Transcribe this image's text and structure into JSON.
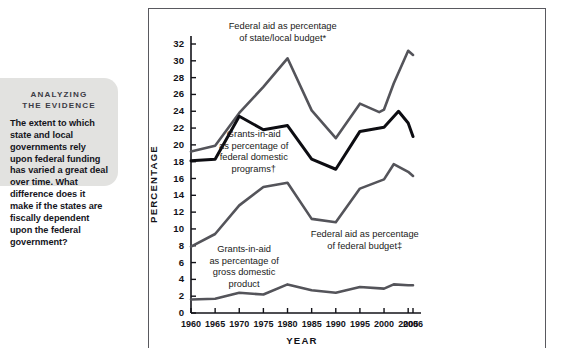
{
  "callout": {
    "kicker_line1": "ANALYZING",
    "kicker_line2": "THE EVIDENCE",
    "body": "The extent to which state and local governments rely upon federal funding has varied a great deal over time. What difference does it make if the states are fiscally dependent upon the federal government?"
  },
  "chart_data": {
    "type": "line",
    "title": "",
    "xlabel": "YEAR",
    "ylabel": "PERCENTAGE",
    "x": [
      1960,
      1965,
      1970,
      1975,
      1980,
      1985,
      1990,
      1995,
      2000,
      2005,
      2006
    ],
    "xtick_labels": [
      "1960",
      "1965",
      "1970",
      "1975",
      "1980",
      "1985",
      "1990",
      "1995",
      "2000",
      "2005",
      "2006"
    ],
    "ytick_labels": [
      "0",
      "2",
      "4",
      "6",
      "8",
      "10",
      "12",
      "14",
      "16",
      "18",
      "20",
      "22",
      "24",
      "26",
      "28",
      "30",
      "32"
    ],
    "ytick_values": [
      0,
      2,
      4,
      6,
      8,
      10,
      12,
      14,
      16,
      18,
      20,
      22,
      24,
      26,
      28,
      30,
      32
    ],
    "ylim": [
      0,
      33
    ],
    "xlim": [
      1960,
      2006
    ],
    "grid": false,
    "legend": "inline-annotations",
    "series": [
      {
        "name": "Federal aid as percentage of state/local budget*",
        "color": "#54545a",
        "width": 2.6,
        "x": [
          1960,
          1965,
          1970,
          1975,
          1980,
          1985,
          1990,
          1995,
          1999,
          2000,
          2002,
          2005,
          2006
        ],
        "values": [
          19.2,
          19.9,
          23.8,
          26.9,
          30.3,
          24.1,
          20.8,
          24.9,
          23.9,
          24.2,
          27.3,
          31.2,
          30.7
        ]
      },
      {
        "name": "Grants-in-aid as percentage of federal domestic programs†",
        "color": "#0d0d12",
        "width": 3.0,
        "x": [
          1960,
          1965,
          1970,
          1975,
          1980,
          1985,
          1990,
          1995,
          2000,
          2003,
          2005,
          2006
        ],
        "values": [
          18.1,
          18.3,
          23.4,
          21.8,
          22.3,
          18.3,
          17.1,
          21.6,
          22.1,
          24.0,
          22.6,
          21.0
        ]
      },
      {
        "name": "Federal aid as percentage of federal budget‡",
        "color": "#54545a",
        "width": 2.6,
        "x": [
          1960,
          1965,
          1970,
          1975,
          1980,
          1985,
          1990,
          1995,
          2000,
          2002,
          2005,
          2006
        ],
        "values": [
          7.9,
          9.4,
          12.8,
          15.0,
          15.5,
          11.2,
          10.8,
          14.8,
          15.9,
          17.7,
          16.8,
          16.3
        ]
      },
      {
        "name": "Grants-in-aid as percentage of gross domestic product",
        "color": "#54545a",
        "width": 2.6,
        "x": [
          1960,
          1965,
          1970,
          1975,
          1980,
          1985,
          1990,
          1995,
          2000,
          2002,
          2005,
          2006
        ],
        "values": [
          1.6,
          1.7,
          2.4,
          2.2,
          3.4,
          2.7,
          2.4,
          3.1,
          2.9,
          3.4,
          3.3,
          3.3
        ]
      }
    ],
    "annotations": [
      {
        "name": "annotation-state-local",
        "lines": [
          "Federal aid as percentage",
          "of state/local budget*"
        ],
        "x": 1979,
        "y_px": 20,
        "anchor": "middle"
      },
      {
        "name": "annotation-federal-domestic",
        "lines": [
          "Grants-in-aid",
          "as percentage of",
          "federal domestic",
          "programs†"
        ],
        "x": 1973,
        "y_px": 128,
        "anchor": "middle"
      },
      {
        "name": "annotation-federal-budget",
        "lines": [
          "Federal aid as percentage",
          "of federal budget‡"
        ],
        "x": 1996,
        "y_px": 228,
        "anchor": "middle"
      },
      {
        "name": "annotation-gdp",
        "lines": [
          "Grants-in-aid",
          "as percentage of",
          "gross domestic",
          "product"
        ],
        "x": 1971,
        "y_px": 243,
        "anchor": "middle"
      }
    ]
  }
}
